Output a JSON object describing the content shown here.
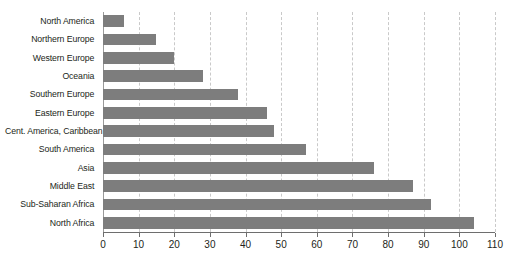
{
  "chart_data": {
    "type": "bar",
    "orientation": "horizontal",
    "title": "",
    "subtitle": "",
    "xlabel": "",
    "ylabel": "",
    "xlim": [
      0,
      110
    ],
    "ylim": null,
    "grid": "vertical-dashed",
    "legend": "none",
    "bar_color": "#7d7d7d",
    "gridline_color": "#c9c9c9",
    "axis_color": "#6e6e6e",
    "text_color": "#231f20",
    "background": "#ffffff",
    "categories": [
      "North America",
      "Northern Europe",
      "Western Europe",
      "Oceania",
      "Southern Europe",
      "Eastern Europe",
      "Cent. America, Caribbean",
      "South America",
      "Asia",
      "Middle East",
      "Sub-Saharan Africa",
      "North Africa"
    ],
    "values": [
      6,
      15,
      20,
      28,
      38,
      46,
      48,
      57,
      76,
      87,
      92,
      104
    ],
    "xticks": [
      0,
      10,
      20,
      30,
      40,
      50,
      60,
      70,
      80,
      90,
      100,
      110
    ],
    "xticklabels": [
      "0",
      "10",
      "20",
      "30",
      "40",
      "50",
      "60",
      "70",
      "80",
      "90",
      "100",
      "110"
    ]
  }
}
